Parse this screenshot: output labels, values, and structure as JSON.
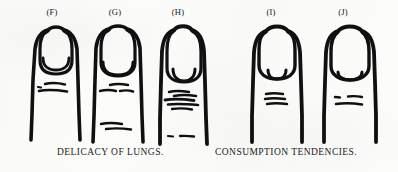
{
  "plate": {
    "background_color": "#fcfcfa",
    "ink_color": "#101010",
    "width": 398,
    "height": 172
  },
  "figures": [
    {
      "label": "(F)",
      "label_x": 32,
      "finger_x": 24,
      "nail_shape": "long-narrow-rounded",
      "lunula": "large-oval",
      "knuckle_mark_count": 3,
      "description": "narrow long nail with large moon"
    },
    {
      "label": "(G)",
      "label_x": 95,
      "finger_x": 86,
      "nail_shape": "long-narrow-rounded",
      "lunula": "wide-low-arc",
      "knuckle_mark_count": 5,
      "description": "narrow long nail with wide low moon"
    },
    {
      "label": "(H)",
      "label_x": 158,
      "finger_x": 150,
      "nail_shape": "very-long-narrow",
      "lunula": "small-deep-arc",
      "knuckle_mark_count": 6,
      "description": "very long nail with small deep-set moon"
    },
    {
      "label": "(I)",
      "label_x": 251,
      "finger_x": 244,
      "nail_shape": "broad-rounded",
      "lunula": "small-half-circle",
      "knuckle_mark_count": 3,
      "description": "broad nail with small half-circle moon"
    },
    {
      "label": "(J)",
      "label_x": 323,
      "finger_x": 316,
      "nail_shape": "broad-squarish",
      "lunula": "flat-wide-arc",
      "knuckle_mark_count": 3,
      "description": "broad squarish nail with flat wide moon"
    }
  ],
  "captions": {
    "left": "DELICACY OF LUNGS.",
    "right": "CONSUMPTION TENDENCIES."
  }
}
